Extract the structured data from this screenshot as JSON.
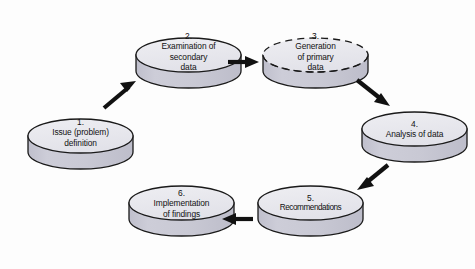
{
  "diagram": {
    "background_color": "#fdfdfd",
    "cylinder_top_color": "#e9e9ee",
    "cylinder_body_color": "#c8c8d3",
    "outline_color": "#1a1a1a",
    "arrow_color": "#111111",
    "nodes": [
      {
        "id": "node-1",
        "number": "1.",
        "lines": [
          "Issue (problem)",
          "definition"
        ],
        "outline_style": "solid"
      },
      {
        "id": "node-2",
        "number": "2.",
        "lines": [
          "Examination of",
          "secondary",
          "data"
        ],
        "outline_style": "solid"
      },
      {
        "id": "node-3",
        "number": "3.",
        "lines": [
          "Generation",
          "of primary",
          "data"
        ],
        "outline_style": "dashed"
      },
      {
        "id": "node-4",
        "number": "4.",
        "lines": [
          "Analysis of data"
        ],
        "outline_style": "solid"
      },
      {
        "id": "node-5",
        "number": "5.",
        "lines": [
          "Recommendations"
        ],
        "outline_style": "solid"
      },
      {
        "id": "node-6",
        "number": "6.",
        "lines": [
          "Implementation",
          "of findings"
        ],
        "outline_style": "solid"
      }
    ],
    "arrows": [
      {
        "id": "arrow-1-to-2",
        "from": "node-1",
        "to": "node-2",
        "direction": "up-right"
      },
      {
        "id": "arrow-2-to-3",
        "from": "node-2",
        "to": "node-3",
        "direction": "right"
      },
      {
        "id": "arrow-3-to-4",
        "from": "node-3",
        "to": "node-4",
        "direction": "down-right"
      },
      {
        "id": "arrow-4-to-5",
        "from": "node-4",
        "to": "node-5",
        "direction": "down-left"
      },
      {
        "id": "arrow-5-to-6",
        "from": "node-5",
        "to": "node-6",
        "direction": "left"
      }
    ]
  }
}
